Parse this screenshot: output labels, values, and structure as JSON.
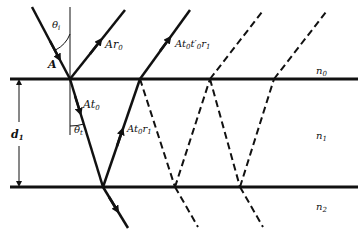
{
  "diagram": {
    "media": [
      {
        "label": "n",
        "sub": "0"
      },
      {
        "label": "n",
        "sub": "1"
      },
      {
        "label": "n",
        "sub": "2"
      }
    ],
    "thickness": {
      "label": "d",
      "sub": "1"
    },
    "angles": {
      "incident": {
        "label": "θ",
        "sub": "i"
      },
      "transmitted": {
        "label": "θ",
        "sub": "t"
      }
    },
    "rays": {
      "incident": {
        "label": "A"
      },
      "reflected": {
        "label": "Ar",
        "sub": "0"
      },
      "transmitted": {
        "label": "At",
        "sub": "0"
      },
      "internal_reflected": {
        "label_pre": "At",
        "sub1": "0",
        "label_post": "r",
        "sub2": "1"
      },
      "second_emerging": {
        "label_pre": "At",
        "sub1": "0",
        "label_mid": "t′",
        "sub2": "0",
        "label_post": "r",
        "sub3": "1"
      }
    },
    "colors": {
      "line": "#111111",
      "background": "#ffffff"
    }
  }
}
